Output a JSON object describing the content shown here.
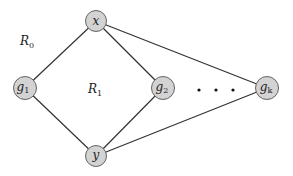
{
  "diagram": {
    "nodes": [
      {
        "id": "x",
        "label": "x",
        "sub": "",
        "cx": 96,
        "cy": 21
      },
      {
        "id": "g1",
        "label": "g",
        "sub": "1",
        "cx": 25,
        "cy": 88
      },
      {
        "id": "g2",
        "label": "g",
        "sub": "2",
        "cx": 163,
        "cy": 88
      },
      {
        "id": "gk",
        "label": "g",
        "sub": "k",
        "cx": 267,
        "cy": 88
      },
      {
        "id": "y",
        "label": "y",
        "sub": "",
        "cx": 96,
        "cy": 156
      }
    ],
    "edges": [
      [
        "x",
        "g1"
      ],
      [
        "x",
        "g2"
      ],
      [
        "x",
        "gk"
      ],
      [
        "y",
        "g1"
      ],
      [
        "y",
        "g2"
      ],
      [
        "y",
        "gk"
      ]
    ],
    "regions": [
      {
        "label": "R",
        "sub": "0",
        "x": 20,
        "y": 45
      },
      {
        "label": "R",
        "sub": "1",
        "x": 88,
        "y": 93
      }
    ],
    "ellipsis": "• • •",
    "colors": {
      "node_fill": "#d3d3d3",
      "node_stroke": "#555555",
      "edge": "#333333"
    }
  }
}
